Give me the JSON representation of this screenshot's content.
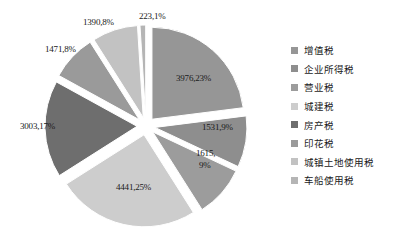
{
  "chart_data": {
    "type": "pie",
    "title": "",
    "exploded": true,
    "legend_position": "right",
    "grid": false,
    "categories": [
      "增值税",
      "企业所得税",
      "营业税",
      "城建税",
      "房产税",
      "印花税",
      "城镇土地使用税",
      "车船使用税"
    ],
    "values": [
      23,
      9,
      9,
      25,
      17,
      8,
      8,
      1
    ],
    "labels": [
      "3976,23%",
      "1531,9%",
      "1615,\n9%",
      "4441,25%",
      "3003,17%",
      "1471,8%",
      "1390,8%",
      "223,1%"
    ],
    "amounts": [
      3976,
      1531,
      1615,
      4441,
      3003,
      1471,
      1390,
      223
    ],
    "percents": [
      23,
      9,
      9,
      25,
      17,
      8,
      8,
      1
    ],
    "colors": [
      "#969696",
      "#8e8e8e",
      "#9c9c9c",
      "#cdcdcd",
      "#6e6e6e",
      "#9a9a9a",
      "#c2c2c2",
      "#b5b5b5"
    ]
  },
  "legend": {
    "items": [
      {
        "label": "增值税",
        "color": "#969696"
      },
      {
        "label": "企业所得税",
        "color": "#8e8e8e"
      },
      {
        "label": "营业税",
        "color": "#9c9c9c"
      },
      {
        "label": "城建税",
        "color": "#cdcdcd"
      },
      {
        "label": "房产税",
        "color": "#6e6e6e"
      },
      {
        "label": "印花税",
        "color": "#9a9a9a"
      },
      {
        "label": "城镇土地使用税",
        "color": "#c2c2c2"
      },
      {
        "label": "车船使用税",
        "color": "#b5b5b5"
      }
    ]
  },
  "slice_labels": [
    {
      "text": "3976,23%",
      "x": 176,
      "y": 73
    },
    {
      "text": "1531,9%",
      "x": 202,
      "y": 122
    },
    {
      "text": "1615,",
      "x": 196,
      "y": 148
    },
    {
      "text": "9%",
      "x": 199,
      "y": 160
    },
    {
      "text": "4441,25%",
      "x": 116,
      "y": 182
    },
    {
      "text": "3003,17%",
      "x": 20,
      "y": 121
    },
    {
      "text": "1471,8%",
      "x": 45,
      "y": 44
    },
    {
      "text": "1390,8%",
      "x": 83,
      "y": 17
    },
    {
      "text": "223,1%",
      "x": 139,
      "y": 11
    }
  ]
}
